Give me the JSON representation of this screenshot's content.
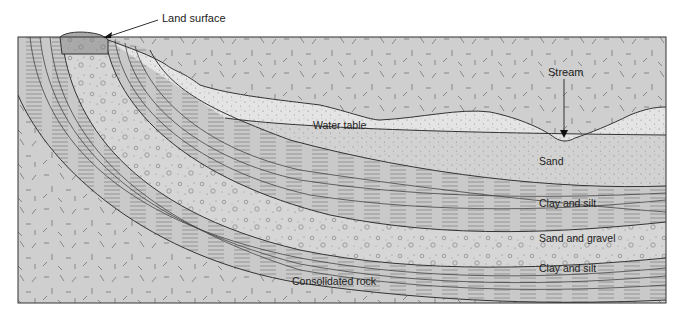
{
  "figure": {
    "labels": {
      "land_surface": "Land surface",
      "stream": "Stream",
      "water_table": "Water table",
      "sand": "Sand",
      "clay_silt_upper": "Clay and silt",
      "sand_gravel": "Sand and gravel",
      "clay_silt_lower": "Clay and silt",
      "consolidated_rock": "Consolidated rock"
    },
    "layers": [
      {
        "id": "unsaturated-sand",
        "name": "Sand (above water table)",
        "fill": "#e4e4e4",
        "pattern": "fine-dots"
      },
      {
        "id": "saturated-sand",
        "name": "Sand",
        "fill": "#d2d2d2",
        "pattern": "fine-dots"
      },
      {
        "id": "clay-silt-upper",
        "name": "Clay and silt",
        "fill": "#c9c9c9",
        "pattern": "horizontal-dashes"
      },
      {
        "id": "sand-gravel",
        "name": "Sand and gravel",
        "fill": "#d6d6d6",
        "pattern": "pebbles"
      },
      {
        "id": "clay-silt-lower",
        "name": "Clay and silt",
        "fill": "#c9c9c9",
        "pattern": "horizontal-dashes"
      },
      {
        "id": "consolidated-rock",
        "name": "Consolidated rock",
        "fill": "#cfcfcf",
        "pattern": "random-ticks"
      },
      {
        "id": "land-surface-cap",
        "name": "Land surface outcrop",
        "fill": "#a9a9a9",
        "pattern": "pebbles"
      }
    ],
    "colors": {
      "outline": "#333333",
      "dashed_line": "#c8c8c8",
      "background": "#ffffff"
    }
  }
}
